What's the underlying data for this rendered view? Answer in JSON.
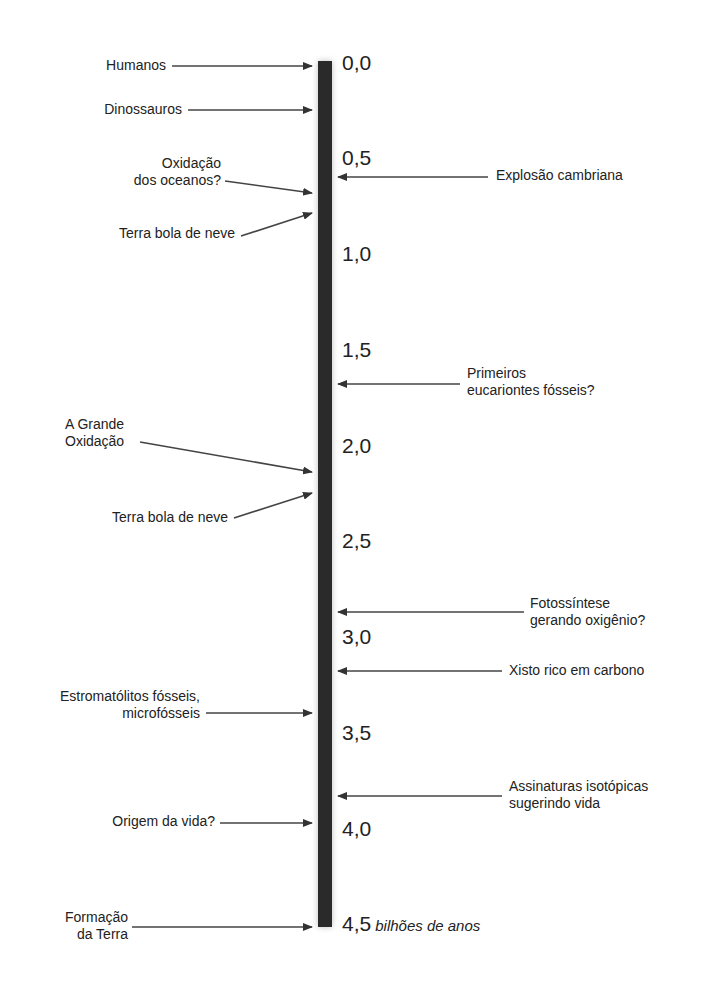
{
  "diagram": {
    "type": "timeline",
    "axis_unit": "bilhões de anos",
    "ticks": [
      "0,0",
      "0,5",
      "1,0",
      "1,5",
      "2,0",
      "2,5",
      "3,0",
      "3,5",
      "4,0",
      "4,5"
    ],
    "left_events": [
      {
        "lines": [
          "Humanos"
        ],
        "age": 0.0
      },
      {
        "lines": [
          "Dinossauros"
        ],
        "age": 0.23
      },
      {
        "lines": [
          "Oxidação",
          "dos oceanos?"
        ],
        "age": 0.68
      },
      {
        "lines": [
          "Terra bola de neve"
        ],
        "age": 0.78
      },
      {
        "lines": [
          "A Grande",
          "Oxidação"
        ],
        "age": 2.2
      },
      {
        "lines": [
          "Terra bola de neve"
        ],
        "age": 2.3
      },
      {
        "lines": [
          "Estromatólitos fósseis,",
          "microfósseis"
        ],
        "age": 3.45
      },
      {
        "lines": [
          "Origem da vida?"
        ],
        "age": 4.0
      },
      {
        "lines": [
          "Formação",
          "da Terra"
        ],
        "age": 4.5
      }
    ],
    "right_events": [
      {
        "lines": [
          "Explosão cambriana"
        ],
        "age": 0.57
      },
      {
        "lines": [
          "Primeiros",
          "eucariontes fósseis?"
        ],
        "age": 1.75
      },
      {
        "lines": [
          "Fotossíntese",
          "gerando oxigênio?"
        ],
        "age": 2.9
      },
      {
        "lines": [
          "Xisto rico em carbono"
        ],
        "age": 3.2
      },
      {
        "lines": [
          "Assinaturas isotópicas",
          "sugerindo vida"
        ],
        "age": 3.85
      }
    ]
  }
}
